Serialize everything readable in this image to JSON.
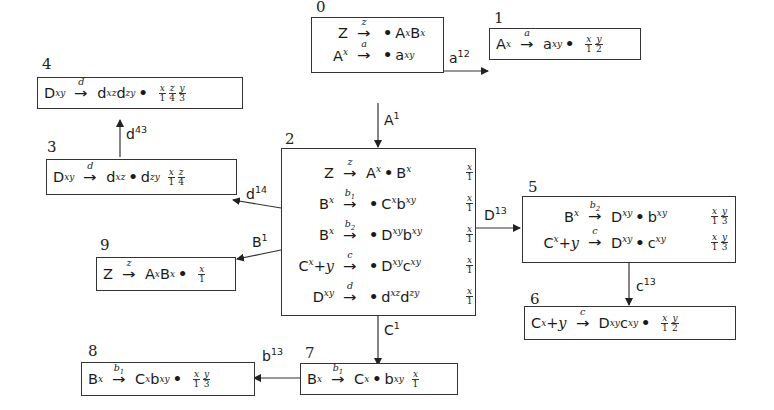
{
  "diagram": {
    "nodes": [
      {
        "id": "0",
        "rules": [
          {
            "lhs": "Z",
            "lhs_sup": "",
            "label": "z",
            "rhs_parts": [
              ".",
              "A",
              "x",
              "B",
              "x"
            ],
            "rhs": "•A^x B^x",
            "fracs": []
          },
          {
            "lhs": "A",
            "lhs_sup": "x",
            "label": "a",
            "rhs": "•a^xy",
            "fracs": []
          }
        ]
      },
      {
        "id": "1",
        "rules": [
          {
            "lhs": "A",
            "lhs_sup": "x",
            "label": "a",
            "rhs": "a^xy •",
            "fracs": [
              [
                "x",
                "1"
              ],
              [
                "y",
                "2"
              ]
            ]
          }
        ]
      },
      {
        "id": "2",
        "rules": [
          {
            "lhs": "Z",
            "lhs_sup": "",
            "label": "z",
            "rhs": "A^x •B^x",
            "fracs": [
              [
                "x",
                "1"
              ]
            ]
          },
          {
            "lhs": "B",
            "lhs_sup": "x",
            "label": "b1",
            "rhs": "•C^x b^xy",
            "fracs": [
              [
                "x",
                "1"
              ]
            ]
          },
          {
            "lhs": "B",
            "lhs_sup": "x",
            "label": "b2",
            "rhs": "•D^xy b^xy",
            "fracs": [
              [
                "x",
                "1"
              ]
            ]
          },
          {
            "lhs": "C",
            "lhs_sup": "x",
            "lhs_suffix": "+y",
            "label": "c",
            "rhs": "•D^xy c^xy",
            "fracs": [
              [
                "x",
                "1"
              ]
            ]
          },
          {
            "lhs": "D",
            "lhs_sup": "xy",
            "label": "d",
            "rhs": "•d^xz d^zy",
            "fracs": [
              [
                "x",
                "1"
              ]
            ]
          }
        ]
      },
      {
        "id": "3",
        "rules": [
          {
            "lhs": "D",
            "lhs_sup": "xy",
            "label": "d",
            "rhs": "d^xz •d^zy",
            "fracs": [
              [
                "x",
                "1"
              ],
              [
                "z",
                "4"
              ]
            ]
          }
        ]
      },
      {
        "id": "4",
        "rules": [
          {
            "lhs": "D",
            "lhs_sup": "xy",
            "label": "d",
            "rhs": "d^xz d^zy •",
            "fracs": [
              [
                "x",
                "1"
              ],
              [
                "z",
                "4"
              ],
              [
                "y",
                "3"
              ]
            ]
          }
        ]
      },
      {
        "id": "5",
        "rules": [
          {
            "lhs": "B",
            "lhs_sup": "x",
            "label": "b2",
            "rhs": "D^xy •b^xy",
            "fracs": [
              [
                "x",
                "1"
              ],
              [
                "y",
                "3"
              ]
            ]
          },
          {
            "lhs": "C",
            "lhs_sup": "x",
            "lhs_suffix": "+y",
            "label": "c",
            "rhs": "D^xy •c^xy",
            "fracs": [
              [
                "x",
                "1"
              ],
              [
                "y",
                "3"
              ]
            ]
          }
        ]
      },
      {
        "id": "6",
        "rules": [
          {
            "lhs": "C",
            "lhs_sup": "x",
            "lhs_suffix": "+y",
            "label": "c",
            "rhs": "D^xy c^xy •",
            "fracs": [
              [
                "x",
                "1"
              ],
              [
                "y",
                "2"
              ]
            ]
          }
        ]
      },
      {
        "id": "7",
        "rules": [
          {
            "lhs": "B",
            "lhs_sup": "x",
            "label": "b1",
            "rhs": "C^x •b^xy",
            "fracs": [
              [
                "x",
                "1"
              ]
            ]
          }
        ]
      },
      {
        "id": "8",
        "rules": [
          {
            "lhs": "B",
            "lhs_sup": "x",
            "label": "b1",
            "rhs": "C^x b^xy •",
            "fracs": [
              [
                "x",
                "1"
              ],
              [
                "y",
                "3"
              ]
            ]
          }
        ]
      },
      {
        "id": "9",
        "rules": [
          {
            "lhs": "Z",
            "lhs_sup": "",
            "label": "z",
            "rhs": "A^x B^x •",
            "fracs": [
              [
                "x",
                "1"
              ]
            ]
          }
        ]
      }
    ],
    "edges": [
      {
        "from": "0",
        "to": "1",
        "label": "a",
        "sup": "12"
      },
      {
        "from": "0",
        "to": "2",
        "label": "A",
        "sup": "1"
      },
      {
        "from": "2",
        "to": "3",
        "label": "d",
        "sup": "14"
      },
      {
        "from": "3",
        "to": "4",
        "label": "d",
        "sup": "43"
      },
      {
        "from": "2",
        "to": "9",
        "label": "B",
        "sup": "1"
      },
      {
        "from": "2",
        "to": "5",
        "label": "D",
        "sup": "13"
      },
      {
        "from": "5",
        "to": "6",
        "label": "c",
        "sup": "13"
      },
      {
        "from": "2",
        "to": "7",
        "label": "C",
        "sup": "1"
      },
      {
        "from": "7",
        "to": "8",
        "label": "b",
        "sup": "13"
      }
    ]
  },
  "text": {
    "ids": [
      "0",
      "1",
      "2",
      "3",
      "4",
      "5",
      "6",
      "7",
      "8",
      "9"
    ],
    "Z": "Z",
    "A": "A",
    "B": "B",
    "C": "C",
    "D": "D",
    "a": "a",
    "b": "b",
    "c": "c",
    "d": "d",
    "x": "x",
    "y": "y",
    "z": "z",
    "xy": "xy",
    "xz": "xz",
    "zy": "zy",
    "b1": "b",
    "one": "1",
    "two": "2",
    "plus_y": "+y",
    "dot": "•",
    "arrow": "→",
    "n1": "1",
    "n2": "2",
    "n3": "3",
    "n4": "4",
    "s12": "12",
    "s1": "1",
    "s14": "14",
    "s43": "43",
    "s13": "13"
  }
}
